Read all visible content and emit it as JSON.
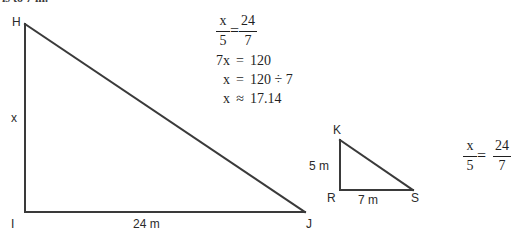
{
  "heading": {
    "clipped_text": "is to 7 in."
  },
  "figure_large": {
    "name": "triangle-HIJ",
    "vertices": [
      {
        "id": "H",
        "label": "H",
        "x": 25,
        "y": 24
      },
      {
        "id": "I",
        "label": "I",
        "x": 25,
        "y": 212
      },
      {
        "id": "J",
        "label": "J",
        "x": 305,
        "y": 212
      }
    ],
    "labels": {
      "H": "H",
      "I": "I",
      "J": "J",
      "leg_vertical": "x",
      "leg_horizontal": "24 m"
    }
  },
  "figure_small": {
    "name": "triangle-KRS",
    "vertices": [
      {
        "id": "K",
        "label": "K",
        "x": 340,
        "y": 140
      },
      {
        "id": "R",
        "label": "R",
        "x": 340,
        "y": 190
      },
      {
        "id": "S",
        "label": "S",
        "x": 413,
        "y": 190
      }
    ],
    "labels": {
      "K": "K",
      "R": "R",
      "S": "S",
      "leg_vertical": "5 m",
      "leg_horizontal": "7 m"
    }
  },
  "work": {
    "line1": {
      "left_num": "x",
      "left_den": "5",
      "relation": "=",
      "right_num": "24",
      "right_den": "7"
    },
    "line2": {
      "lhs": "7x",
      "relation": "=",
      "rhs": "120"
    },
    "line3": {
      "lhs": "x",
      "relation": "=",
      "rhs": "120 ÷ 7"
    },
    "line4": {
      "lhs": "x",
      "relation": "≈",
      "rhs": "17.14"
    }
  },
  "proportion_right": {
    "left_num": "x",
    "left_den": "5",
    "relation": "=",
    "right_num": "24",
    "right_den": "7"
  },
  "style": {
    "background": "#ffffff",
    "line_color": "#3a3a3a",
    "text_color": "#2b2b2b"
  }
}
